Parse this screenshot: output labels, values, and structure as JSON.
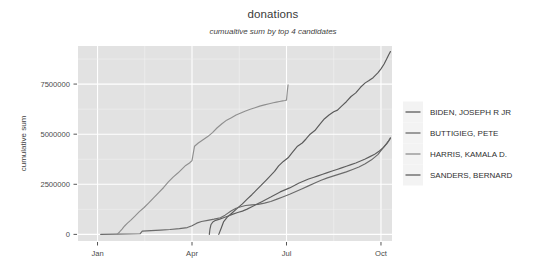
{
  "chart_data": {
    "type": "line",
    "title": "donations",
    "subtitle": "cumualtive sum by top 4 candidates",
    "xlabel": "",
    "ylabel": "cumulative sum",
    "legend_position": "right",
    "grid": true,
    "x_tick_labels": [
      "Jan",
      "Apr",
      "Jul",
      "Oct"
    ],
    "x_tick_values": [
      0,
      3,
      6,
      9
    ],
    "xlim": [
      -0.62,
      9.35
    ],
    "y_tick_labels": [
      "0",
      "2500000",
      "5000000",
      "7500000"
    ],
    "y_tick_values": [
      0,
      2500000,
      5000000,
      7500000
    ],
    "ylim": [
      -330000,
      9400000
    ],
    "series": [
      {
        "name": "BIDEN, JOSEPH R JR",
        "color": "#5a5a5a",
        "x": [
          3.85,
          3.92,
          4.0,
          4.12,
          4.28,
          4.45,
          4.6,
          4.75,
          4.9,
          5.05,
          5.2,
          5.35,
          5.5,
          5.62,
          5.75,
          5.9,
          6.05,
          6.2,
          6.35,
          6.5,
          6.62,
          6.75,
          6.9,
          7.05,
          7.2,
          7.35,
          7.5,
          7.62,
          7.75,
          7.9,
          8.05,
          8.2,
          8.35,
          8.5,
          8.62,
          8.75,
          8.9,
          9.0,
          9.1,
          9.18,
          9.25,
          9.3
        ],
        "y": [
          0,
          280000,
          620000,
          860000,
          1080000,
          1320000,
          1520000,
          1760000,
          1980000,
          2220000,
          2460000,
          2700000,
          2940000,
          3140000,
          3420000,
          3640000,
          3820000,
          4120000,
          4400000,
          4560000,
          4760000,
          5000000,
          5180000,
          5480000,
          5760000,
          5960000,
          6120000,
          6200000,
          6400000,
          6620000,
          6880000,
          7060000,
          7340000,
          7560000,
          7680000,
          7820000,
          8060000,
          8260000,
          8500000,
          8750000,
          8980000,
          9120000
        ]
      },
      {
        "name": "BUTTIGIEG, PETE",
        "color": "#6b6b6b",
        "x": [
          0.1,
          0.6,
          1.0,
          1.35,
          1.42,
          1.7,
          2.0,
          2.3,
          2.6,
          2.85,
          3.0,
          3.15,
          3.3,
          3.5,
          3.7,
          3.9,
          4.05,
          4.25,
          4.4,
          4.55,
          4.7,
          4.9,
          5.1,
          5.3,
          5.5,
          5.7,
          5.9,
          6.1,
          6.3,
          6.5,
          6.7,
          6.9,
          7.1,
          7.3,
          7.5,
          7.7,
          7.9,
          8.1,
          8.3,
          8.5,
          8.7,
          8.9,
          9.05,
          9.15,
          9.25,
          9.3
        ],
        "y": [
          0,
          10000,
          20000,
          30000,
          160000,
          190000,
          215000,
          245000,
          290000,
          340000,
          430000,
          560000,
          640000,
          700000,
          760000,
          830000,
          960000,
          1180000,
          1300000,
          1380000,
          1440000,
          1470000,
          1500000,
          1560000,
          1640000,
          1760000,
          1880000,
          2000000,
          2140000,
          2280000,
          2420000,
          2560000,
          2700000,
          2820000,
          2920000,
          3020000,
          3120000,
          3240000,
          3360000,
          3520000,
          3720000,
          3980000,
          4280000,
          4480000,
          4680000,
          4790000
        ]
      },
      {
        "name": "HARRIS, KAMALA D.",
        "color": "#8f8f8f",
        "x": [
          0.62,
          0.7,
          0.78,
          0.86,
          0.95,
          1.05,
          1.18,
          1.32,
          1.48,
          1.62,
          1.78,
          1.95,
          2.1,
          2.25,
          2.4,
          2.55,
          2.68,
          2.8,
          2.92,
          3.0,
          3.08,
          3.2,
          3.35,
          3.5,
          3.65,
          3.8,
          3.95,
          4.1,
          4.25,
          4.4,
          4.55,
          4.7,
          4.85,
          5.0,
          5.15,
          5.3,
          5.45,
          5.58,
          5.68,
          5.78,
          5.88,
          5.95,
          6.0,
          6.03,
          6.05
        ],
        "y": [
          0,
          120000,
          260000,
          420000,
          560000,
          700000,
          900000,
          1120000,
          1340000,
          1560000,
          1820000,
          2100000,
          2340000,
          2620000,
          2860000,
          3060000,
          3260000,
          3440000,
          3560000,
          3680000,
          4400000,
          4560000,
          4720000,
          4880000,
          5080000,
          5320000,
          5520000,
          5700000,
          5820000,
          5960000,
          6060000,
          6160000,
          6240000,
          6320000,
          6400000,
          6460000,
          6520000,
          6570000,
          6600000,
          6630000,
          6660000,
          6680000,
          6700000,
          7200000,
          7460000
        ]
      },
      {
        "name": "SANDERS, BERNARD",
        "color": "#5f5f5f",
        "x": [
          3.55,
          3.57,
          3.6,
          3.66,
          3.75,
          3.88,
          4.0,
          4.15,
          4.3,
          4.45,
          4.6,
          4.75,
          4.9,
          5.05,
          5.2,
          5.35,
          5.5,
          5.65,
          5.8,
          5.95,
          6.1,
          6.25,
          6.4,
          6.55,
          6.7,
          6.85,
          7.0,
          7.15,
          7.3,
          7.45,
          7.6,
          7.75,
          7.9,
          8.05,
          8.2,
          8.35,
          8.5,
          8.65,
          8.8,
          8.95,
          9.08,
          9.18,
          9.25,
          9.3
        ],
        "y": [
          0,
          260000,
          480000,
          620000,
          700000,
          760000,
          830000,
          920000,
          1010000,
          1090000,
          1160000,
          1260000,
          1380000,
          1500000,
          1620000,
          1740000,
          1860000,
          1990000,
          2120000,
          2220000,
          2320000,
          2440000,
          2560000,
          2660000,
          2760000,
          2840000,
          2920000,
          3000000,
          3080000,
          3160000,
          3240000,
          3320000,
          3400000,
          3480000,
          3560000,
          3660000,
          3760000,
          3880000,
          4000000,
          4160000,
          4340000,
          4520000,
          4680000,
          4820000
        ]
      }
    ]
  },
  "legend": {
    "items": [
      {
        "label": "BIDEN, JOSEPH R JR",
        "color": "#5a5a5a"
      },
      {
        "label": "BUTTIGIEG, PETE",
        "color": "#6b6b6b"
      },
      {
        "label": "HARRIS, KAMALA D.",
        "color": "#8f8f8f"
      },
      {
        "label": "SANDERS, BERNARD",
        "color": "#5f5f5f"
      }
    ]
  },
  "colors": {
    "panel_background": "#e2e2e2",
    "grid_major": "#ffffff",
    "figure_background": "#ffffff",
    "text": "#4a4a4a"
  }
}
